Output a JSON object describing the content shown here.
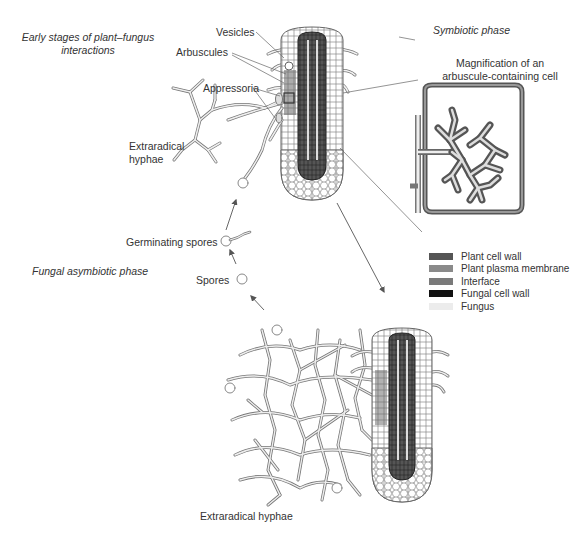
{
  "titles": {
    "early_stages": "Early stages of plant–fungus interactions",
    "early_line1": "Early stages of plant–fungus",
    "early_line2": "interactions",
    "symbiotic": "Symbiotic phase",
    "asymbiotic": "Fungal asymbiotic phase"
  },
  "labels": {
    "vesicles": "Vesicles",
    "arbuscules": "Arbuscules",
    "appressoria": "Appressoria",
    "extraradical_top_line1": "Extraradical",
    "extraradical_top_line2": "hyphae",
    "germinating_spores": "Germinating spores",
    "spores": "Spores",
    "magnification_line1": "Magnification of an",
    "magnification_line2": "arbuscule-containing cell",
    "extraradical_bottom": "Extraradical hyphae"
  },
  "legend": {
    "items": [
      {
        "label": "Plant cell wall",
        "color": "#555555"
      },
      {
        "label": "Plant plasma membrane",
        "color": "#8a8a8a"
      },
      {
        "label": "Interface",
        "color": "#7a7a7a"
      },
      {
        "label": "Fungal cell wall",
        "color": "#111111"
      },
      {
        "label": "Fungus",
        "color": "#ececec"
      }
    ]
  },
  "colors": {
    "line": "#555555",
    "root_cell": "#777777",
    "stele": "#3a3a3a",
    "hypha_outline": "#777777",
    "hypha_fill": "#eeeeee"
  }
}
